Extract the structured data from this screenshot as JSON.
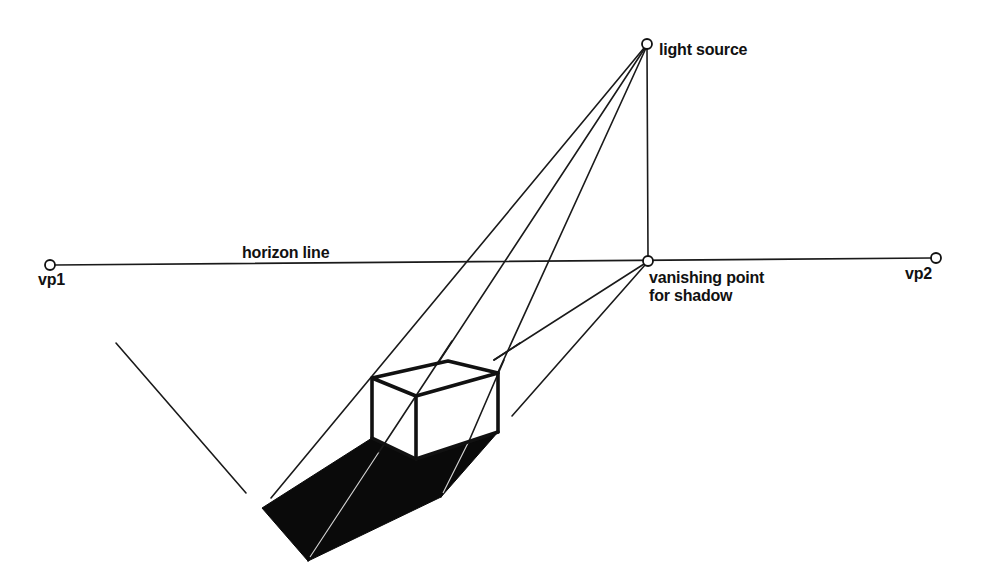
{
  "diagram": {
    "colors": {
      "background": "#ffffff",
      "ink": "#111111",
      "shadow_fill": "#0a0a0a"
    },
    "labels": {
      "light_source": "light source",
      "horizon_line": "horizon line",
      "vp1": "vp1",
      "vp2": "vp2",
      "shadow_vp_line1": "vanishing point",
      "shadow_vp_line2": "for shadow"
    },
    "points": {
      "light_source": [
        647,
        44
      ],
      "vp1": [
        50,
        265
      ],
      "vp2": [
        936,
        258
      ],
      "shadow_vanishing_point": [
        648,
        261
      ]
    },
    "box": {
      "top_left": [
        372,
        378
      ],
      "top_back": [
        448,
        361
      ],
      "top_right": [
        498,
        373
      ],
      "top_front": [
        416,
        396
      ],
      "bottom_left": [
        372,
        438
      ],
      "bottom_front": [
        416,
        459
      ],
      "bottom_right": [
        498,
        432
      ]
    },
    "shadow_polygon": [
      [
        372,
        438
      ],
      [
        262,
        508
      ],
      [
        308,
        561
      ],
      [
        441,
        497
      ],
      [
        498,
        432
      ],
      [
        416,
        459
      ]
    ],
    "rays_from_light": [
      {
        "from": [
          647,
          44
        ],
        "to": [
          271,
          498
        ]
      },
      {
        "from": [
          647,
          44
        ],
        "to": [
          308,
          561
        ]
      },
      {
        "from": [
          647,
          44
        ],
        "to": [
          441,
          497
        ]
      }
    ],
    "lines_from_shadow_vp": [
      {
        "from": [
          648,
          261
        ],
        "to": [
          494,
          360
        ]
      },
      {
        "from": [
          648,
          261
        ],
        "to": [
          512,
          416
        ]
      }
    ],
    "vertical_line": {
      "from": [
        647,
        44
      ],
      "to": [
        648,
        261
      ]
    },
    "construction_line_left": {
      "from": [
        116,
        343
      ],
      "to": [
        246,
        493
      ]
    }
  }
}
